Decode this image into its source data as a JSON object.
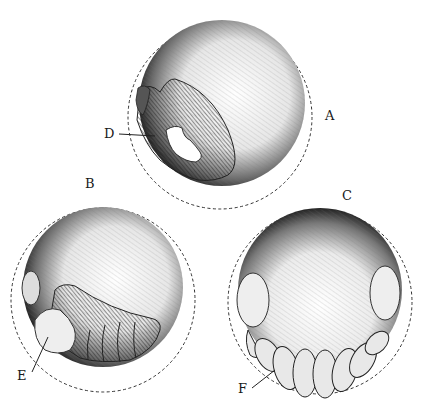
{
  "figure": {
    "panels": [
      {
        "id": "A",
        "label": "A",
        "description": "egg with early embryo, part D"
      },
      {
        "id": "B",
        "label": "B",
        "description": "egg with curled embryo, part E"
      },
      {
        "id": "C",
        "label": "C",
        "description": "egg with segmented embryo, part F"
      }
    ],
    "annotations": [
      {
        "label": "D",
        "panel": "A"
      },
      {
        "label": "E",
        "panel": "B"
      },
      {
        "label": "F",
        "panel": "C"
      }
    ],
    "colors": {
      "ink": "#1a1a1a",
      "paper": "#ffffff",
      "shade": "#555555"
    }
  }
}
